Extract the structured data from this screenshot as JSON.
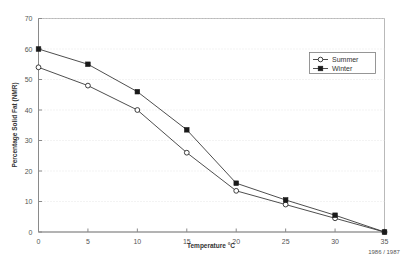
{
  "chart_data": {
    "type": "line",
    "title": "",
    "xlabel": "Temperature °C",
    "ylabel": "Percentage Solid Fat (NMR)",
    "xlim": [
      0,
      35
    ],
    "ylim": [
      0,
      70
    ],
    "xticks": [
      0,
      5,
      10,
      15,
      20,
      25,
      30,
      35
    ],
    "yticks": [
      0,
      10,
      20,
      30,
      40,
      50,
      60,
      70
    ],
    "grid": true,
    "legend_position": "top-right",
    "x": [
      0,
      5,
      10,
      15,
      20,
      25,
      30,
      35
    ],
    "series": [
      {
        "name": "Summer",
        "marker": "open-circle",
        "values": [
          54,
          48,
          40,
          26,
          13.5,
          9,
          4.5,
          0
        ]
      },
      {
        "name": "Winter",
        "marker": "filled-square",
        "values": [
          60,
          55,
          46,
          33.5,
          16,
          10.5,
          5.5,
          0
        ]
      }
    ],
    "annotations": [
      {
        "text": "1986 / 1987",
        "near": "x-axis-right"
      }
    ]
  },
  "legend": {
    "entries": [
      {
        "label": "Summer"
      },
      {
        "label": "Winter"
      }
    ]
  },
  "axes": {
    "x_title": "Temperature °C",
    "y_title": "Percentage Solid Fat (NMR)",
    "x_tick_labels": [
      "0",
      "5",
      "10",
      "15",
      "20",
      "25",
      "30",
      "35"
    ],
    "y_tick_labels": [
      "0",
      "10",
      "20",
      "30",
      "40",
      "50",
      "60",
      "70"
    ]
  },
  "footnote": {
    "period": "1986 / 1987"
  },
  "colors": {
    "series_line": "#3a3a3a",
    "grid": "#dcdcdc",
    "frame": "#b9b9b9",
    "axis": "#8a8a8a",
    "background": "#ffffff"
  }
}
